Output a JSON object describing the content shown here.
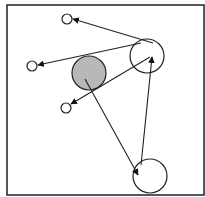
{
  "diagram": {
    "frame": {
      "x": 7,
      "y": 5,
      "width": 197,
      "height": 190,
      "stroke": "#222222"
    },
    "colors": {
      "stroke": "#222222",
      "fill_default": "#ffffff",
      "fill_highlight": "#b8b8b8"
    },
    "nodes": [
      {
        "id": "small-top",
        "cx": 67,
        "cy": 19,
        "r": 5,
        "fill": "#ffffff"
      },
      {
        "id": "small-left",
        "cx": 32,
        "cy": 66,
        "r": 5,
        "fill": "#ffffff"
      },
      {
        "id": "small-bottom-left",
        "cx": 66,
        "cy": 108,
        "r": 5,
        "fill": "#ffffff"
      },
      {
        "id": "grey-center",
        "cx": 89,
        "cy": 73,
        "r": 17,
        "fill": "#b8b8b8"
      },
      {
        "id": "large-top-right",
        "cx": 147,
        "cy": 56,
        "r": 17,
        "fill": "#ffffff"
      },
      {
        "id": "large-bottom",
        "cx": 150,
        "cy": 176,
        "r": 17,
        "fill": "#ffffff"
      }
    ],
    "edges": [
      {
        "from": "large-top-right",
        "to": "small-top",
        "x1": 153,
        "y1": 43,
        "x2": 73,
        "y2": 19
      },
      {
        "from": "large-top-right",
        "to": "small-left",
        "x1": 141,
        "y1": 43,
        "x2": 38,
        "y2": 65
      },
      {
        "from": "large-top-right",
        "to": "small-bottom-left",
        "x1": 150,
        "y1": 57,
        "x2": 71,
        "y2": 104
      },
      {
        "from": "grey-center",
        "to": "large-bottom",
        "x1": 85,
        "y1": 79,
        "x2": 138,
        "y2": 175
      },
      {
        "from": "large-bottom",
        "to": "large-top-right",
        "x1": 141,
        "y1": 165,
        "x2": 152,
        "y2": 57
      }
    ]
  }
}
